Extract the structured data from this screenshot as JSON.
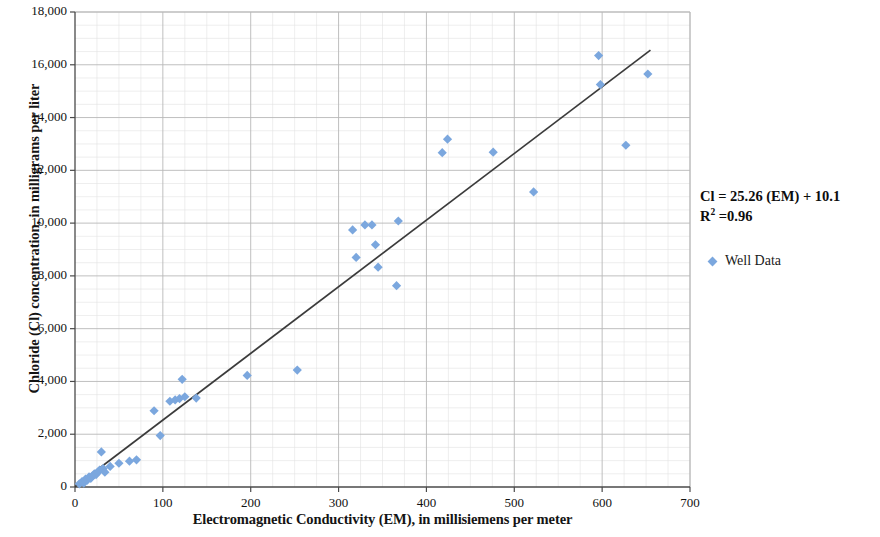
{
  "chart_data": {
    "type": "scatter",
    "title": "",
    "xlabel": "Electromagnetic Conductivity (EM), in millisiemens per meter",
    "ylabel": "Chloride (Cl) concentration, in milligrams per liter",
    "xlim": [
      0,
      700
    ],
    "ylim": [
      0,
      18000
    ],
    "xticks": [
      0,
      100,
      200,
      300,
      400,
      500,
      600,
      700
    ],
    "xtick_labels": [
      "0",
      "100",
      "200",
      "300",
      "400",
      "500",
      "600",
      "700"
    ],
    "yticks": [
      0,
      2000,
      4000,
      6000,
      8000,
      10000,
      12000,
      14000,
      16000,
      18000
    ],
    "ytick_labels": [
      "0",
      "2,000",
      "4,000",
      "6,000",
      "8,000",
      "10,000",
      "12,000",
      "14,000",
      "16,000",
      "18,000"
    ],
    "grid": true,
    "minor_grid": true,
    "legend_position": "right",
    "marker_color": "#7BA7DE",
    "marker_shape": "diamond",
    "trendline_color": "#3b3b3b",
    "gridline_color": "#b8b8b8",
    "minor_gridline_color": "#e2e2e2",
    "axis_color": "#4a4a4a",
    "series": [
      {
        "name": "Well Data",
        "points": [
          [
            5,
            120
          ],
          [
            8,
            200
          ],
          [
            10,
            150
          ],
          [
            12,
            300
          ],
          [
            14,
            260
          ],
          [
            16,
            380
          ],
          [
            18,
            330
          ],
          [
            20,
            420
          ],
          [
            22,
            500
          ],
          [
            24,
            470
          ],
          [
            26,
            560
          ],
          [
            28,
            640
          ],
          [
            30,
            1330
          ],
          [
            32,
            700
          ],
          [
            34,
            560
          ],
          [
            40,
            780
          ],
          [
            50,
            900
          ],
          [
            62,
            980
          ],
          [
            70,
            1030
          ],
          [
            90,
            2890
          ],
          [
            97,
            1950
          ],
          [
            108,
            3250
          ],
          [
            114,
            3300
          ],
          [
            119,
            3350
          ],
          [
            122,
            4080
          ],
          [
            125,
            3420
          ],
          [
            138,
            3370
          ],
          [
            196,
            4230
          ],
          [
            253,
            4430
          ],
          [
            316,
            9740
          ],
          [
            320,
            8700
          ],
          [
            330,
            9930
          ],
          [
            338,
            9930
          ],
          [
            342,
            9180
          ],
          [
            345,
            8330
          ],
          [
            368,
            10080
          ],
          [
            366,
            7630
          ],
          [
            418,
            12670
          ],
          [
            424,
            13180
          ],
          [
            476,
            12690
          ],
          [
            522,
            11180
          ],
          [
            596,
            16350
          ],
          [
            598,
            15250
          ],
          [
            627,
            12950
          ],
          [
            652,
            15650
          ]
        ]
      }
    ],
    "trendline": {
      "equation": "Cl = 25.26 (EM) + 10.1",
      "slope": 25.26,
      "intercept": 10.1,
      "r_squared": 0.96,
      "x_start": 0,
      "x_end": 655
    }
  },
  "annotation": {
    "equation": "Cl = 25.26 (EM) + 10.1",
    "r2_prefix": "R",
    "r2_superscript": "2",
    "r2_value": " =0.96"
  },
  "legend": {
    "marker_name": "diamond-marker",
    "label": "Well Data"
  }
}
